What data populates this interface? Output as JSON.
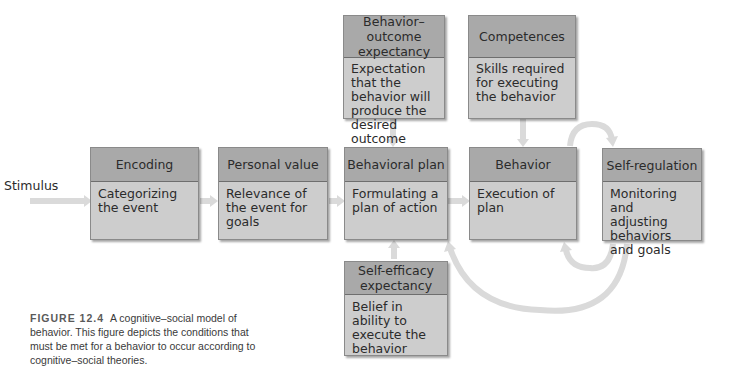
{
  "diagram": {
    "input_label": "Stimulus",
    "boxes": [
      {
        "id": "encoding",
        "title": "Encoding",
        "description": "Categorizing the event"
      },
      {
        "id": "personal-value",
        "title": "Personal value",
        "description": "Relevance of  the event for goals"
      },
      {
        "id": "behavioral-plan",
        "title": "Behavioral plan",
        "description": "Formulating a plan of action"
      },
      {
        "id": "behavior",
        "title": "Behavior",
        "description": "Execution of plan"
      },
      {
        "id": "self-regulation",
        "title": "Self-regulation",
        "description": "Monitoring and adjusting behaviors and goals"
      },
      {
        "id": "behavior-outcome-expectancy",
        "title": "Behavior–outcome expectancy",
        "description": "Expectation that the behavior will produce the desired outcome"
      },
      {
        "id": "competences",
        "title": "Competences",
        "description": "Skills required for executing the behavior"
      },
      {
        "id": "self-efficacy-expectancy",
        "title": "Self-efficacy expectancy",
        "description": "Belief in ability to execute the behavior"
      }
    ]
  },
  "caption": {
    "figure_number": "FIGURE 12.4",
    "text": "A cognitive–social model of behavior. This figure depicts the conditions that must be met for a behavior to occur according to cognitive–social theories."
  },
  "colors": {
    "header": "#a9a9a9",
    "body": "#cdcdcd",
    "arrow": "#dadada"
  }
}
